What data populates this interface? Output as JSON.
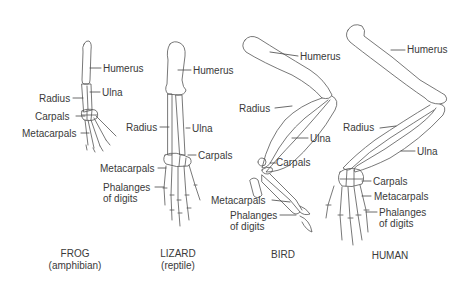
{
  "diagram": {
    "colors": {
      "line": "#555555",
      "text": "#3a3a3a",
      "background": "#ffffff"
    },
    "specimens": [
      {
        "id": "frog",
        "name": "FROG",
        "subtitle": "(amphibian)",
        "labels": {
          "humerus": "Humerus",
          "ulna": "Ulna",
          "radius": "Radius",
          "carpals": "Carpals",
          "metacarpals": "Metacarpals"
        }
      },
      {
        "id": "lizard",
        "name": "LIZARD",
        "subtitle": "(reptile)",
        "labels": {
          "humerus": "Humerus",
          "radius": "Radius",
          "ulna": "Ulna",
          "carpals": "Carpals",
          "metacarpals": "Metacarpals",
          "phalanges_line1": "Phalanges",
          "phalanges_line2": "of digits"
        }
      },
      {
        "id": "bird",
        "name": "BIRD",
        "subtitle": "",
        "labels": {
          "humerus": "Humerus",
          "radius": "Radius",
          "ulna": "Ulna",
          "carpals": "Carpals",
          "metacarpals": "Metacarpals",
          "phalanges_line1": "Phalanges",
          "phalanges_line2": "of digits"
        }
      },
      {
        "id": "human",
        "name": "HUMAN",
        "subtitle": "",
        "labels": {
          "humerus": "Humerus",
          "radius": "Radius",
          "ulna": "Ulna",
          "carpals": "Carpals",
          "metacarpals": "Metacarpals",
          "phalanges_line1": "Phalanges",
          "phalanges_line2": "of digits"
        }
      }
    ]
  }
}
